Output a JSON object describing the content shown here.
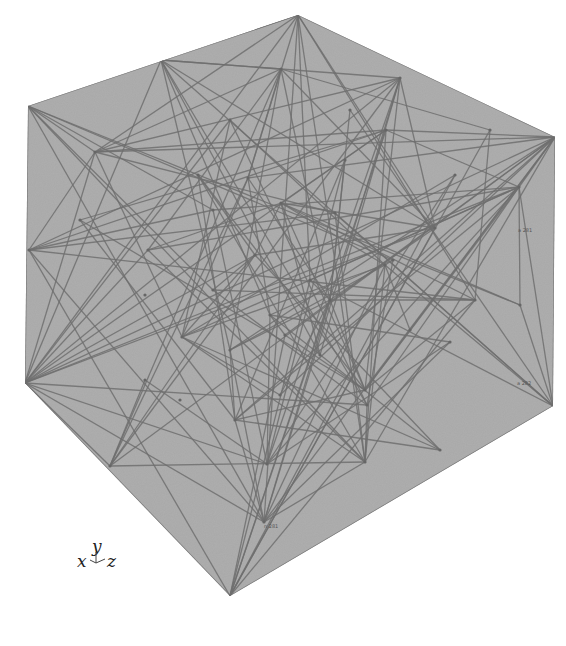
{
  "figure": {
    "fill_color": "#a9a9a9",
    "line_color": "#6e6e6e",
    "background": "#ffffff"
  },
  "axes_triad": {
    "x_label": "x",
    "y_label": "y",
    "z_label": "z"
  },
  "node_labels": [
    "a 281",
    "a 282",
    "n 281"
  ]
}
